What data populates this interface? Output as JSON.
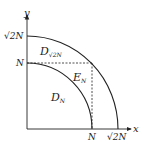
{
  "diagram": {
    "axes": {
      "x_label": "x",
      "y_label": "y"
    },
    "y_ticks": [
      {
        "label": "√2N",
        "value": "sqrt2N"
      },
      {
        "label": "N",
        "value": "N"
      }
    ],
    "x_ticks": [
      {
        "label": "N",
        "value": "N"
      },
      {
        "label": "√2N",
        "value": "sqrt2N"
      }
    ],
    "regions": {
      "outer": {
        "label": "D",
        "subscript": "√2N"
      },
      "inner": {
        "label": "D",
        "subscript": "N"
      },
      "square_corner": {
        "label": "E",
        "subscript": "N"
      }
    },
    "colors": {
      "line": "#222222",
      "background": "#ffffff"
    }
  }
}
